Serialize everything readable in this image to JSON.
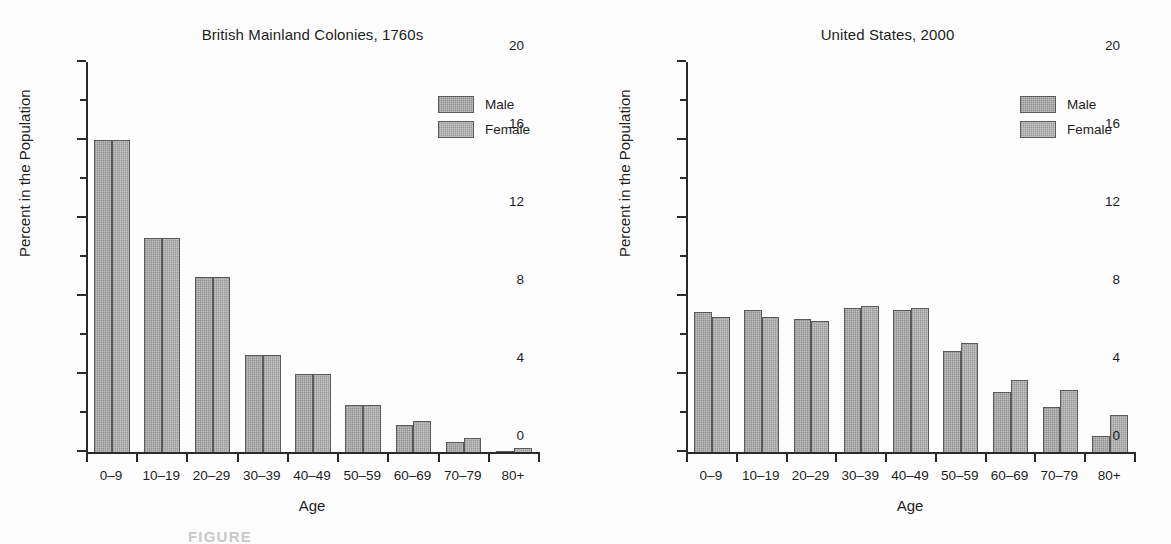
{
  "caption": "FIGURE",
  "legend": {
    "male_label": "Male",
    "female_label": "Female"
  },
  "axes": {
    "xlabel": "Age",
    "ylabel": "Percent in the Population",
    "yticks": [
      "20",
      "16",
      "12",
      "8",
      "4",
      "0"
    ],
    "yminor": [
      18,
      14,
      10,
      6,
      2
    ],
    "ylim": [
      0,
      20
    ]
  },
  "colors": {
    "male": "#9c9c9c",
    "female": "#a4a4a4",
    "axis": "#2a2a2a",
    "text": "#1d1d1d",
    "background": "#fdfdfd"
  },
  "chart_data": [
    {
      "type": "bar",
      "title": "British Mainland Colonies, 1760s",
      "xlabel": "Age",
      "ylabel": "Percent in the Population",
      "ylim": [
        0,
        20
      ],
      "ytick_values": [
        0,
        4,
        8,
        12,
        16,
        20
      ],
      "grid": false,
      "legend_position": "top-right",
      "categories": [
        "0–9",
        "10–19",
        "20–29",
        "30–39",
        "40–49",
        "50–59",
        "60–69",
        "70–79",
        "80+"
      ],
      "series": [
        {
          "name": "Male",
          "values": [
            16.0,
            11.0,
            9.0,
            5.0,
            4.0,
            2.4,
            1.4,
            0.5,
            0.05
          ]
        },
        {
          "name": "Female",
          "values": [
            16.0,
            11.0,
            9.0,
            5.0,
            4.0,
            2.4,
            1.6,
            0.7,
            0.2
          ]
        }
      ]
    },
    {
      "type": "bar",
      "title": "United States, 2000",
      "xlabel": "Age",
      "ylabel": "Percent in the Population",
      "ylim": [
        0,
        20
      ],
      "ytick_values": [
        0,
        4,
        8,
        12,
        16,
        20
      ],
      "grid": false,
      "legend_position": "top-right",
      "categories": [
        "0–9",
        "10–19",
        "20–29",
        "30–39",
        "40–49",
        "50–59",
        "60–69",
        "70–79",
        "80+"
      ],
      "series": [
        {
          "name": "Male",
          "values": [
            7.2,
            7.3,
            6.8,
            7.4,
            7.3,
            5.2,
            3.1,
            2.3,
            0.8
          ]
        },
        {
          "name": "Female",
          "values": [
            6.9,
            6.9,
            6.7,
            7.5,
            7.4,
            5.6,
            3.7,
            3.2,
            1.9
          ]
        }
      ]
    }
  ]
}
